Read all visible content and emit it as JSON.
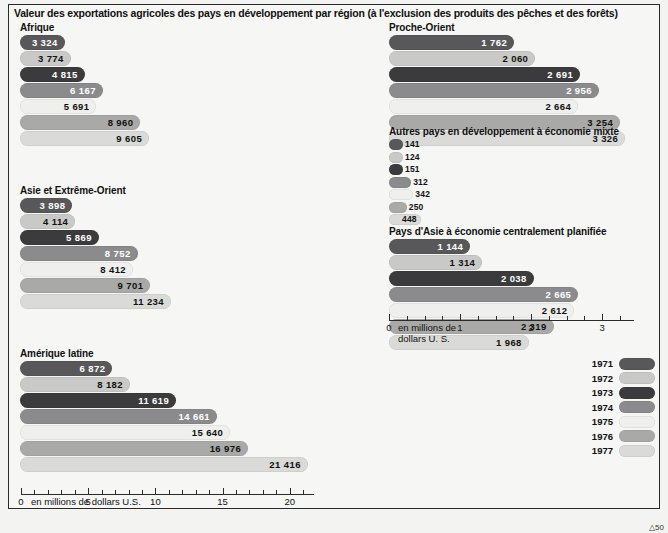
{
  "title": "Valeur des exportations agricoles des pays en développement par région (à l'exclusion des produits des pêches et des forêts)",
  "corner_mark": "△50",
  "legend": {
    "name": "Années",
    "items": [
      {
        "year": "1971",
        "color": "#58585a"
      },
      {
        "year": "1972",
        "color": "#c9c9c7"
      },
      {
        "year": "1973",
        "color": "#3b3b3d"
      },
      {
        "year": "1974",
        "color": "#8b8b8d"
      },
      {
        "year": "1975",
        "color": "#efefed"
      },
      {
        "year": "1976",
        "color": "#a9a9a7"
      },
      {
        "year": "1977",
        "color": "#dadad8"
      }
    ]
  },
  "axes": {
    "left": {
      "unit": "en millions de dollars U.S.",
      "zero_label": "0",
      "ticks": [
        0,
        5,
        10,
        15,
        20
      ],
      "tick_labels": [
        "0",
        "5",
        "10",
        "15",
        "20"
      ],
      "max": 21.8
    },
    "right": {
      "unit_line1": "en millions de",
      "unit_line2": "dollars U. S.",
      "zero_label": "0",
      "ticks": [
        0,
        1,
        2,
        3
      ],
      "tick_labels": [
        "0",
        "1",
        "2",
        "3"
      ],
      "max": 3.45
    }
  },
  "chart_data": {
    "type": "bar",
    "title": "Valeur des exportations agricoles des pays en développement par région (à l'exclusion des produits des pêches et des forêts)",
    "xlabel": "en millions de dollars U.S.",
    "ylabel": "",
    "grid": false,
    "legend_position": "bottom-right",
    "categories": [
      "1971",
      "1972",
      "1973",
      "1974",
      "1975",
      "1976",
      "1977"
    ],
    "panels": [
      {
        "name": "Afrique",
        "scale": "left",
        "values": [
          3324,
          3774,
          4815,
          6167,
          5691,
          8960,
          9605
        ],
        "labels": [
          "3 324",
          "3 774",
          "4 815",
          "6 167",
          "5 691",
          "8 960",
          "9 605"
        ]
      },
      {
        "name": "Asie et Extrême-Orient",
        "scale": "left",
        "values": [
          3898,
          4114,
          5869,
          8752,
          8412,
          9701,
          11234
        ],
        "labels": [
          "3 898",
          "4 114",
          "5 869",
          "8 752",
          "8 412",
          "9 701",
          "11 234"
        ]
      },
      {
        "name": "Amérique latine",
        "scale": "left",
        "values": [
          6872,
          8182,
          11619,
          14661,
          15640,
          16976,
          21416
        ],
        "labels": [
          "6 872",
          "8 182",
          "11 619",
          "14 661",
          "15 640",
          "16 976",
          "21 416"
        ]
      },
      {
        "name": "Proche-Orient",
        "scale": "right",
        "values": [
          1762,
          2060,
          2691,
          2956,
          2664,
          3254,
          3326
        ],
        "labels": [
          "1 762",
          "2 060",
          "2 691",
          "2 956",
          "2 664",
          "3 254",
          "3 326"
        ]
      },
      {
        "name": "Autres pays en développement à économie mixte",
        "scale": "right",
        "values": [
          141,
          124,
          151,
          312,
          342,
          250,
          448
        ],
        "labels": [
          "141",
          "124",
          "151",
          "312",
          "342",
          "250",
          "448"
        ]
      },
      {
        "name": "Pays d'Asie à économie centralement planifiée",
        "scale": "right",
        "values": [
          1144,
          1314,
          2038,
          2665,
          2612,
          2319,
          1968
        ],
        "labels": [
          "1 144",
          "1 314",
          "2 038",
          "2 665",
          "2 612",
          "2 319",
          "1 968"
        ]
      }
    ]
  }
}
